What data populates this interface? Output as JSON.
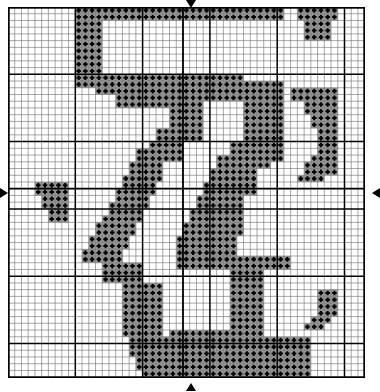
{
  "document": {
    "type": "cross-stitch-pattern-chart",
    "title": "Cross Stitch Pattern Chart",
    "caption": ""
  },
  "grid": {
    "columns": 53,
    "rows": 55,
    "cell_size_px": 6.73,
    "origin_x_px": 8,
    "origin_y_px": 7,
    "minor_line_color": "#6b6b6b",
    "minor_line_width": 0.6,
    "major_line_color": "#000000",
    "major_line_width": 1.5,
    "major_every": 10,
    "border_color": "#000000",
    "border_width": 2,
    "background_color": "#ffffff"
  },
  "symbol": {
    "name": "plus-stitch-symbol",
    "glyph": "+",
    "fill_color": "#9a9a9a",
    "glyph_color": "#000000",
    "legend_label": "+"
  },
  "center_markers": {
    "top": "down-arrow",
    "bottom": "up-arrow",
    "left": "right-arrow",
    "right": "left-arrow",
    "center_column": 26,
    "center_row": 27,
    "marker_color": "#000000"
  },
  "chart_data": {
    "type": "heatmap",
    "xlabel": "",
    "ylabel": "",
    "grid": true,
    "legend": [
      {
        "symbol": "+",
        "color": "#9a9a9a",
        "label": "stitch"
      }
    ],
    "rows": 55,
    "cols": 53,
    "filled_cells_runs": [
      {
        "row": 0,
        "runs": [
          [
            10,
            13
          ],
          [
            14,
            23
          ],
          [
            24,
            34
          ],
          [
            35,
            40
          ]
        ]
      },
      {
        "row": 1,
        "runs": [
          [
            10,
            13
          ],
          [
            14,
            23
          ],
          [
            24,
            34
          ],
          [
            35,
            40
          ]
        ]
      },
      {
        "row": 2,
        "runs": [
          [
            10,
            13
          ]
        ]
      },
      {
        "row": 3,
        "runs": [
          [
            10,
            13
          ]
        ]
      },
      {
        "row": 4,
        "runs": [
          [
            10,
            13
          ]
        ]
      },
      {
        "row": 5,
        "runs": [
          [
            10,
            13
          ]
        ]
      },
      {
        "row": 6,
        "runs": [
          [
            10,
            13
          ]
        ]
      },
      {
        "row": 7,
        "runs": [
          [
            10,
            13
          ]
        ]
      },
      {
        "row": 8,
        "runs": [
          [
            10,
            13
          ]
        ]
      },
      {
        "row": 9,
        "runs": [
          [
            10,
            13
          ]
        ]
      },
      {
        "row": 10,
        "runs": [
          [
            10,
            13
          ],
          [
            14,
            23
          ],
          [
            24,
            34
          ]
        ]
      },
      {
        "row": 11,
        "runs": [
          [
            10,
            13
          ],
          [
            14,
            23
          ],
          [
            24,
            34
          ],
          [
            35,
            40
          ]
        ]
      },
      {
        "row": 12,
        "runs": [
          [
            13,
            23
          ],
          [
            24,
            34
          ],
          [
            35,
            40
          ]
        ]
      },
      {
        "row": 13,
        "runs": [
          [
            16,
            23
          ],
          [
            24,
            34
          ],
          [
            35,
            40
          ]
        ]
      },
      {
        "row": 14,
        "runs": [
          [
            16,
            23
          ],
          [
            24,
            28
          ],
          [
            35,
            40
          ]
        ]
      },
      {
        "row": 15,
        "runs": [
          [
            24,
            28
          ],
          [
            35,
            40
          ]
        ]
      },
      {
        "row": 16,
        "runs": [
          [
            24,
            28
          ],
          [
            35,
            40
          ]
        ]
      },
      {
        "row": 17,
        "runs": [
          [
            24,
            28
          ],
          [
            35,
            40
          ]
        ]
      },
      {
        "row": 18,
        "runs": [
          [
            22,
            28
          ],
          [
            35,
            40
          ]
        ]
      },
      {
        "row": 19,
        "runs": [
          [
            22,
            28
          ],
          [
            35,
            40
          ]
        ]
      },
      {
        "row": 20,
        "runs": [
          [
            21,
            25
          ],
          [
            33,
            40
          ]
        ]
      },
      {
        "row": 21,
        "runs": [
          [
            19,
            25
          ],
          [
            33,
            40
          ]
        ]
      },
      {
        "row": 22,
        "runs": [
          [
            19,
            25
          ],
          [
            31,
            40
          ]
        ]
      },
      {
        "row": 23,
        "runs": [
          [
            18,
            22
          ],
          [
            31,
            38
          ]
        ]
      },
      {
        "row": 24,
        "runs": [
          [
            18,
            22
          ],
          [
            30,
            36
          ]
        ]
      },
      {
        "row": 25,
        "runs": [
          [
            17,
            22
          ],
          [
            30,
            36
          ]
        ]
      },
      {
        "row": 26,
        "runs": [
          [
            17,
            21
          ],
          [
            29,
            36
          ]
        ]
      },
      {
        "row": 27,
        "runs": [
          [
            16,
            21
          ],
          [
            29,
            36
          ]
        ]
      },
      {
        "row": 28,
        "runs": [
          [
            16,
            20
          ],
          [
            28,
            34
          ]
        ]
      },
      {
        "row": 29,
        "runs": [
          [
            15,
            20
          ],
          [
            28,
            34
          ]
        ]
      },
      {
        "row": 30,
        "runs": [
          [
            15,
            19
          ],
          [
            27,
            34
          ]
        ]
      },
      {
        "row": 31,
        "runs": [
          [
            14,
            19
          ],
          [
            27,
            34
          ]
        ]
      },
      {
        "row": 32,
        "runs": [
          [
            13,
            18
          ],
          [
            26,
            34
          ]
        ]
      },
      {
        "row": 33,
        "runs": [
          [
            13,
            18
          ],
          [
            26,
            34
          ]
        ]
      },
      {
        "row": 34,
        "runs": [
          [
            12,
            17
          ],
          [
            25,
            33
          ]
        ]
      },
      {
        "row": 35,
        "runs": [
          [
            12,
            17
          ],
          [
            25,
            33
          ]
        ]
      },
      {
        "row": 36,
        "runs": [
          [
            11,
            16
          ],
          [
            25,
            33
          ]
        ]
      },
      {
        "row": 37,
        "runs": [
          [
            11,
            16
          ],
          [
            25,
            41
          ]
        ]
      },
      {
        "row": 38,
        "runs": [
          [
            14,
            19
          ],
          [
            25,
            41
          ]
        ]
      },
      {
        "row": 39,
        "runs": [
          [
            14,
            19
          ],
          [
            33,
            37
          ]
        ]
      },
      {
        "row": 40,
        "runs": [
          [
            14,
            19
          ],
          [
            33,
            37
          ]
        ]
      },
      {
        "row": 41,
        "runs": [
          [
            17,
            22
          ],
          [
            33,
            37
          ]
        ]
      },
      {
        "row": 42,
        "runs": [
          [
            17,
            22
          ],
          [
            33,
            37
          ]
        ]
      },
      {
        "row": 43,
        "runs": [
          [
            17,
            22
          ],
          [
            33,
            37
          ]
        ]
      },
      {
        "row": 44,
        "runs": [
          [
            17,
            22
          ],
          [
            33,
            37
          ]
        ]
      },
      {
        "row": 45,
        "runs": [
          [
            17,
            22
          ],
          [
            33,
            37
          ]
        ]
      },
      {
        "row": 46,
        "runs": [
          [
            17,
            22
          ],
          [
            33,
            37
          ]
        ]
      },
      {
        "row": 47,
        "runs": [
          [
            17,
            22
          ],
          [
            33,
            37
          ]
        ]
      },
      {
        "row": 48,
        "runs": [
          [
            17,
            22
          ],
          [
            24,
            33
          ],
          [
            33,
            37
          ]
        ]
      },
      {
        "row": 49,
        "runs": [
          [
            18,
            23
          ],
          [
            24,
            33
          ],
          [
            33,
            44
          ]
        ]
      },
      {
        "row": 50,
        "runs": [
          [
            18,
            23
          ],
          [
            24,
            33
          ],
          [
            33,
            44
          ]
        ]
      },
      {
        "row": 51,
        "runs": [
          [
            18,
            23
          ],
          [
            24,
            33
          ],
          [
            33,
            44
          ]
        ]
      },
      {
        "row": 52,
        "runs": [
          [
            19,
            23
          ],
          [
            24,
            33
          ],
          [
            33,
            44
          ]
        ]
      },
      {
        "row": 53,
        "runs": [
          [
            19,
            23
          ],
          [
            24,
            33
          ],
          [
            33,
            44
          ]
        ]
      },
      {
        "row": 54,
        "runs": [
          [
            20,
            23
          ],
          [
            24,
            33
          ],
          [
            33,
            44
          ]
        ]
      }
    ],
    "extra_filled_cells": [
      [
        0,
        43
      ],
      [
        0,
        44
      ],
      [
        0,
        45
      ],
      [
        0,
        46
      ],
      [
        0,
        47
      ],
      [
        0,
        48
      ],
      [
        1,
        43
      ],
      [
        1,
        44
      ],
      [
        1,
        45
      ],
      [
        1,
        46
      ],
      [
        1,
        47
      ],
      [
        1,
        48
      ],
      [
        2,
        44
      ],
      [
        2,
        45
      ],
      [
        2,
        46
      ],
      [
        2,
        47
      ],
      [
        3,
        44
      ],
      [
        3,
        45
      ],
      [
        3,
        46
      ],
      [
        3,
        47
      ],
      [
        4,
        44
      ],
      [
        4,
        45
      ],
      [
        4,
        46
      ],
      [
        4,
        47
      ],
      [
        12,
        42
      ],
      [
        12,
        43
      ],
      [
        12,
        44
      ],
      [
        12,
        45
      ],
      [
        12,
        46
      ],
      [
        12,
        47
      ],
      [
        12,
        48
      ],
      [
        13,
        42
      ],
      [
        13,
        43
      ],
      [
        13,
        44
      ],
      [
        13,
        45
      ],
      [
        13,
        46
      ],
      [
        13,
        47
      ],
      [
        13,
        48
      ],
      [
        14,
        44
      ],
      [
        14,
        45
      ],
      [
        14,
        46
      ],
      [
        14,
        47
      ],
      [
        14,
        48
      ],
      [
        15,
        44
      ],
      [
        15,
        45
      ],
      [
        15,
        46
      ],
      [
        15,
        47
      ],
      [
        15,
        48
      ],
      [
        16,
        45
      ],
      [
        16,
        46
      ],
      [
        16,
        47
      ],
      [
        16,
        48
      ],
      [
        17,
        45
      ],
      [
        17,
        46
      ],
      [
        17,
        47
      ],
      [
        17,
        48
      ],
      [
        18,
        46
      ],
      [
        18,
        47
      ],
      [
        18,
        48
      ],
      [
        19,
        46
      ],
      [
        19,
        47
      ],
      [
        19,
        48
      ],
      [
        20,
        46
      ],
      [
        20,
        47
      ],
      [
        20,
        48
      ],
      [
        21,
        46
      ],
      [
        21,
        47
      ],
      [
        21,
        48
      ],
      [
        22,
        45
      ],
      [
        22,
        46
      ],
      [
        22,
        47
      ],
      [
        22,
        48
      ],
      [
        23,
        44
      ],
      [
        23,
        45
      ],
      [
        23,
        46
      ],
      [
        23,
        47
      ],
      [
        23,
        48
      ],
      [
        24,
        44
      ],
      [
        24,
        45
      ],
      [
        24,
        46
      ],
      [
        24,
        47
      ],
      [
        24,
        48
      ],
      [
        25,
        43
      ],
      [
        25,
        44
      ],
      [
        25,
        45
      ],
      [
        25,
        46
      ],
      [
        26,
        4
      ],
      [
        26,
        5
      ],
      [
        26,
        6
      ],
      [
        26,
        7
      ],
      [
        26,
        8
      ],
      [
        27,
        4
      ],
      [
        27,
        5
      ],
      [
        27,
        6
      ],
      [
        27,
        7
      ],
      [
        27,
        8
      ],
      [
        28,
        5
      ],
      [
        28,
        6
      ],
      [
        28,
        7
      ],
      [
        28,
        8
      ],
      [
        29,
        5
      ],
      [
        29,
        6
      ],
      [
        29,
        7
      ],
      [
        29,
        8
      ],
      [
        30,
        6
      ],
      [
        30,
        7
      ],
      [
        30,
        8
      ],
      [
        31,
        6
      ],
      [
        31,
        7
      ],
      [
        31,
        8
      ],
      [
        42,
        46
      ],
      [
        42,
        47
      ],
      [
        42,
        48
      ],
      [
        43,
        46
      ],
      [
        43,
        47
      ],
      [
        43,
        48
      ],
      [
        44,
        46
      ],
      [
        44,
        47
      ],
      [
        44,
        48
      ],
      [
        45,
        46
      ],
      [
        45,
        47
      ],
      [
        45,
        48
      ],
      [
        46,
        45
      ],
      [
        46,
        46
      ],
      [
        46,
        47
      ],
      [
        47,
        44
      ],
      [
        47,
        45
      ],
      [
        47,
        46
      ]
    ]
  }
}
